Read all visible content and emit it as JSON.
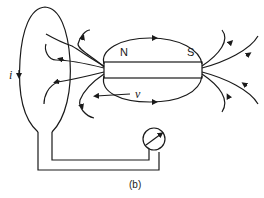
{
  "diagram": {
    "caption": "(b)",
    "magnet": {
      "north_label": "N",
      "south_label": "S"
    },
    "labels": {
      "current": "i",
      "velocity": "v"
    },
    "components": [
      "wire-loop",
      "bar-magnet",
      "magnetic-field-lines",
      "galvanometer",
      "velocity-arrow"
    ],
    "colors": {
      "ink": "#1a1a1a",
      "background": "#ffffff"
    }
  }
}
